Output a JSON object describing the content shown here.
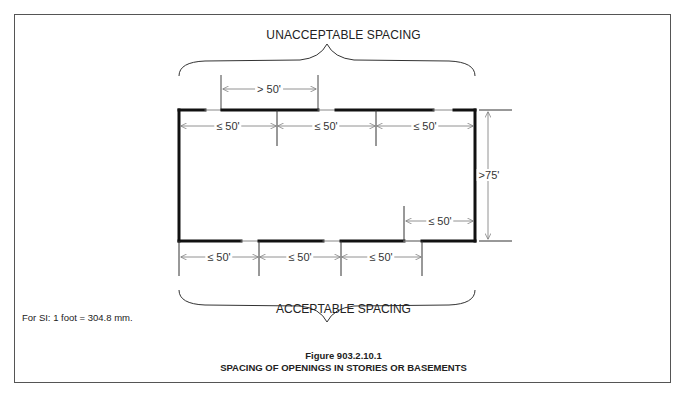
{
  "figure": {
    "top_label": "UNACCEPTABLE SPACING",
    "bottom_label": "ACCEPTABLE SPACING",
    "si_note": "For SI:   1 foot = 304.8 mm.",
    "figure_number": "Figure 903.2.10.1",
    "caption": "SPACING OF OPENINGS IN STORIES OR BASEMENTS"
  },
  "dimensions": {
    "unacceptable_gap": "> 50'",
    "top_segments": [
      "≤ 50'",
      "≤ 50'",
      "≤ 50'"
    ],
    "bottom_segments": [
      "≤ 50'",
      "≤ 50'",
      "≤ 50'"
    ],
    "right_inner": "≤ 50'",
    "height": ">75'"
  },
  "colors": {
    "wall": "#111111",
    "opening": "#888888",
    "dimension_line": "#777777",
    "frame": "#555555",
    "text": "#222222"
  }
}
